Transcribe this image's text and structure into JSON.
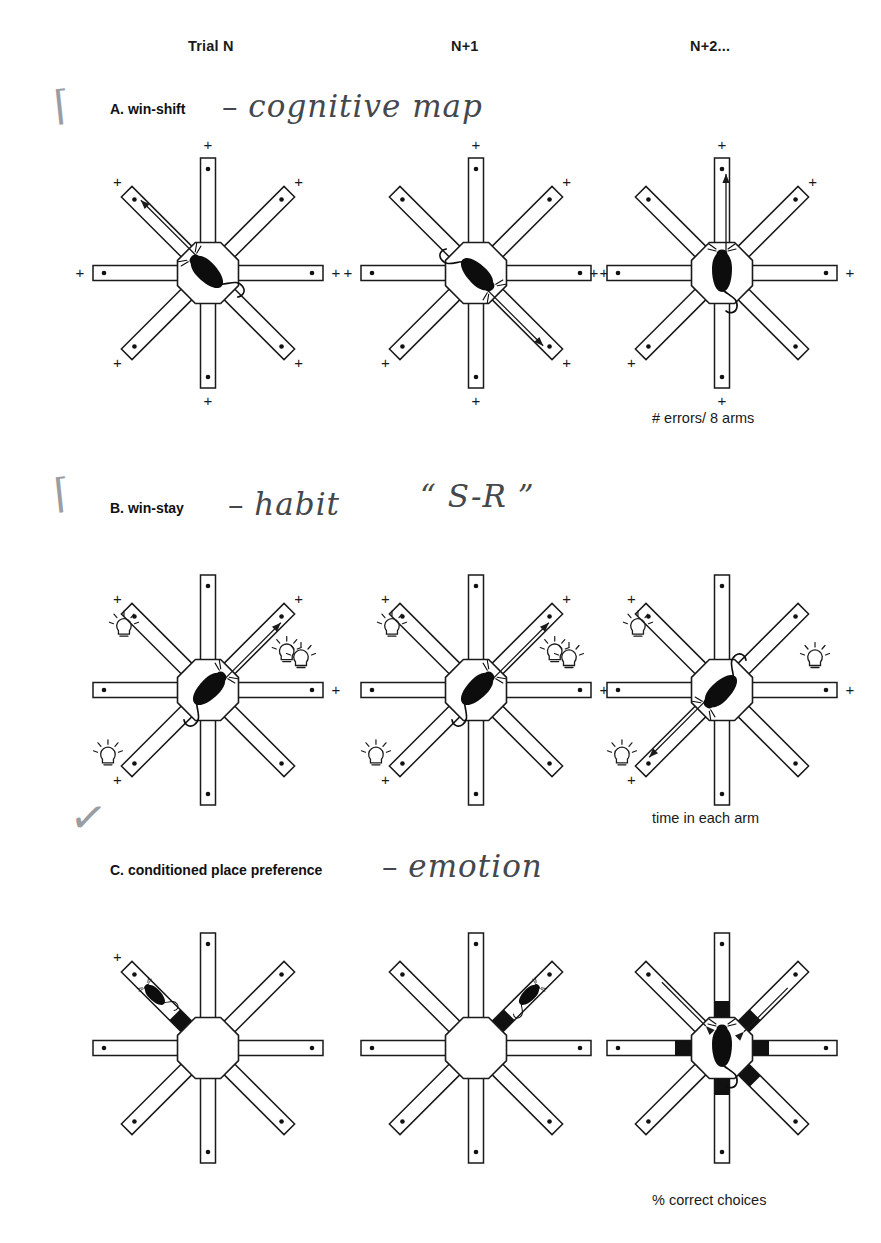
{
  "figure": {
    "columns": [
      {
        "label": "Trial N",
        "x": 188
      },
      {
        "label": "N+1",
        "x": 451
      },
      {
        "label": "N+2...",
        "x": 690
      }
    ],
    "sections": [
      {
        "id": "A",
        "heading": "A. win-shift",
        "annotation_dash": "–",
        "annotation": "cognitive map",
        "tick": "⌈",
        "caption": "# errors/ 8 arms"
      },
      {
        "id": "B",
        "heading": "B. win-stay",
        "annotation_dash": "–",
        "annotation": "habit",
        "annotation2": "“ S-R ”",
        "tick": "⌈",
        "caption": "time in each arm"
      },
      {
        "id": "C",
        "heading": "C. conditioned place preference",
        "annotation_dash": "–",
        "annotation": "emotion",
        "tick": "✓",
        "caption": "% correct choices"
      }
    ],
    "colors": {
      "ink": "#1a1a1a",
      "fill": "#ffffff",
      "pencil": "#44484d",
      "band": "#111111"
    },
    "mazes": [
      {
        "panel": "A",
        "trial": "Trial N",
        "cx": 208,
        "cy": 273,
        "plus_arms": [
          "N",
          "NE",
          "E",
          "SE",
          "S",
          "SW",
          "W",
          "NW"
        ],
        "bulb_arms": [],
        "band_arms": [],
        "arrow": {
          "dir": "NW",
          "type": "out"
        },
        "rat": {
          "where": "hub",
          "heading": "NW"
        }
      },
      {
        "panel": "A",
        "trial": "N+1",
        "cx": 476,
        "cy": 273,
        "plus_arms": [
          "N",
          "NE",
          "E",
          "SE",
          "S",
          "SW",
          "W"
        ],
        "bulb_arms": [],
        "band_arms": [],
        "arrow": {
          "dir": "SE",
          "type": "out"
        },
        "rat": {
          "where": "hub",
          "heading": "SE"
        }
      },
      {
        "panel": "A",
        "trial": "N+2...",
        "cx": 722,
        "cy": 273,
        "plus_arms": [
          "N",
          "NE",
          "E",
          "S",
          "SW",
          "W"
        ],
        "bulb_arms": [],
        "band_arms": [],
        "arrow": {
          "dir": "N",
          "type": "out"
        },
        "rat": {
          "where": "hub",
          "heading": "N"
        }
      },
      {
        "panel": "B",
        "trial": "Trial N",
        "cx": 208,
        "cy": 690,
        "plus_arms": [
          "NW",
          "NE",
          "E",
          "SW"
        ],
        "bulb_arms": [
          "NW",
          "NE",
          "E",
          "SW"
        ],
        "band_arms": [],
        "arrow": {
          "dir": "NE",
          "type": "out"
        },
        "rat": {
          "where": "hub",
          "heading": "NE"
        }
      },
      {
        "panel": "B",
        "trial": "N+1",
        "cx": 476,
        "cy": 690,
        "plus_arms": [
          "NW",
          "NE",
          "E",
          "SW"
        ],
        "bulb_arms": [
          "NW",
          "NE",
          "E",
          "SW"
        ],
        "band_arms": [],
        "arrow": {
          "dir": "NE",
          "type": "out"
        },
        "rat": {
          "where": "hub",
          "heading": "NE"
        }
      },
      {
        "panel": "B",
        "trial": "N+2...",
        "cx": 722,
        "cy": 690,
        "plus_arms": [
          "NW",
          "E",
          "SW"
        ],
        "bulb_arms": [
          "NW",
          "E",
          "SW"
        ],
        "band_arms": [],
        "arrow": {
          "dir": "SW",
          "type": "out"
        },
        "rat": {
          "where": "hub",
          "heading": "SW"
        }
      },
      {
        "panel": "C",
        "trial": "Trial N",
        "cx": 208,
        "cy": 1048,
        "plus_arms": [
          "NW"
        ],
        "bulb_arms": [],
        "band_arms": [
          "NW"
        ],
        "arrow": null,
        "rat": {
          "where": "arm",
          "heading": "NW"
        }
      },
      {
        "panel": "C",
        "trial": "N+1",
        "cx": 476,
        "cy": 1048,
        "plus_arms": [],
        "bulb_arms": [],
        "band_arms": [
          "NE"
        ],
        "arrow": null,
        "rat": {
          "where": "arm",
          "heading": "NE"
        }
      },
      {
        "panel": "C",
        "trial": "N+2...",
        "cx": 722,
        "cy": 1048,
        "plus_arms": [],
        "bulb_arms": [],
        "band_arms": [
          "N",
          "NE",
          "E",
          "SE",
          "S",
          "W"
        ],
        "arrow": {
          "dir": "NW",
          "type": "in",
          "second": "NE"
        },
        "rat": {
          "where": "hub",
          "heading": "N"
        }
      }
    ],
    "geometry": {
      "arm_len": 82,
      "arm_width": 15,
      "hub_radius": 33,
      "well_inset": 11,
      "plus_offset": 13,
      "band_len": 19
    }
  }
}
